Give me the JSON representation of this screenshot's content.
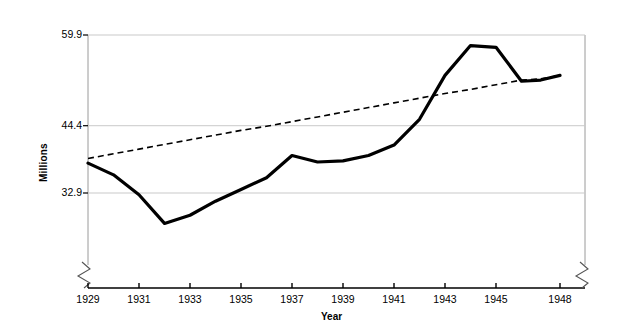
{
  "chart_data": {
    "type": "line",
    "title": "",
    "xlabel": "Year",
    "ylabel": "Millions",
    "ylim": [
      32.9,
      59.9
    ],
    "yticks": [
      32.9,
      44.4,
      59.9
    ],
    "ytick_labels": [
      "32.9",
      "44.4",
      "59.9"
    ],
    "xlim": [
      1929,
      1948
    ],
    "xticks": [
      1929,
      1931,
      1933,
      1935,
      1937,
      1939,
      1941,
      1943,
      1945,
      1948
    ],
    "xtick_labels": [
      "1929",
      "1931",
      "1933",
      "1935",
      "1937",
      "1939",
      "1941",
      "1943",
      "1945",
      "1948"
    ],
    "grid": "horizontal",
    "axis_break_left": true,
    "axis_break_right": true,
    "legend": "none",
    "x": [
      1929,
      1930,
      1931,
      1932,
      1933,
      1934,
      1935,
      1936,
      1937,
      1938,
      1939,
      1940,
      1941,
      1942,
      1943,
      1944,
      1945,
      1946,
      1947,
      1948
    ],
    "series": [
      {
        "name": "Employment",
        "style": "solid",
        "color": "#000000",
        "width": 3.2,
        "values": [
          38.0,
          36.0,
          32.6,
          27.7,
          29.1,
          31.5,
          33.5,
          35.5,
          39.3,
          38.2,
          38.4,
          39.3,
          41.1,
          45.5,
          53.0,
          58.1,
          57.8,
          52.0,
          52.2,
          53.0
        ]
      },
      {
        "name": "Trend",
        "style": "dashed",
        "color": "#000000",
        "width": 1.6,
        "values": [
          38.8,
          39.6,
          40.4,
          41.2,
          42.0,
          42.8,
          43.6,
          44.3,
          45.1,
          45.9,
          46.7,
          47.5,
          48.3,
          49.1,
          49.9,
          50.6,
          51.4,
          52.2,
          52.4,
          53.0
        ]
      }
    ],
    "gridline_color": "#c9c9c9",
    "axis_color": "#000000",
    "background": "#ffffff"
  },
  "labels": {
    "y_axis_title": "Millions",
    "x_axis_title": "Year"
  }
}
